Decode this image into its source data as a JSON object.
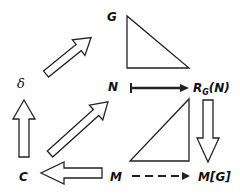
{
  "diagram": {
    "nodes": {
      "G": "G",
      "delta": "δ",
      "N": "N",
      "R": "R",
      "R_sub": "G",
      "R_arg": "(N)",
      "C": "C",
      "M": "M",
      "MG": "M[G]"
    },
    "edges": [
      {
        "from": "δ",
        "to": "G",
        "style": "hollow-arrow"
      },
      {
        "from": "C",
        "to": "δ",
        "style": "hollow-arrow"
      },
      {
        "from": "C",
        "to": "N",
        "style": "hollow-arrow"
      },
      {
        "from": "M",
        "to": "C",
        "style": "hollow-arrow"
      },
      {
        "from": "R_G(N)",
        "to": "M[G]",
        "style": "hollow-arrow"
      },
      {
        "from": "N",
        "to": "R_G(N)",
        "style": "maps-to"
      },
      {
        "from": "M",
        "to": "M[G]",
        "style": "dashed"
      }
    ],
    "triangles": [
      "upper-right-triangle",
      "lower-right-triangle"
    ]
  }
}
